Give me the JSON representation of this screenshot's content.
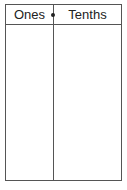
{
  "table": {
    "columns": [
      {
        "label": "Ones"
      },
      {
        "label": "Tenths"
      }
    ],
    "decimal_point": "•",
    "rows": []
  }
}
